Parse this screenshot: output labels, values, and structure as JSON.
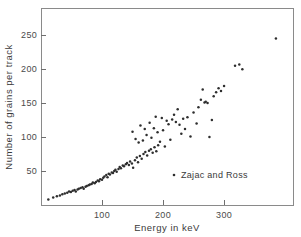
{
  "chart_data": {
    "type": "scatter",
    "title": "",
    "xlabel": "Energy in keV",
    "ylabel": "Number of grains per track",
    "xlim": [
      0,
      413
    ],
    "ylim": [
      0,
      290
    ],
    "xticks": [
      100,
      200,
      300
    ],
    "xtick_labels": [
      "100",
      "200",
      "300"
    ],
    "yticks": [
      50,
      100,
      150,
      200,
      250
    ],
    "ytick_labels": [
      "50",
      "100",
      "150",
      "200",
      "250"
    ],
    "grid": false,
    "legend_position": "center-right",
    "series": [
      {
        "name": "Zajac and Ross",
        "marker": "dot",
        "color": "#2e2e2e",
        "points": [
          [
            12,
            8
          ],
          [
            20,
            11
          ],
          [
            26,
            13
          ],
          [
            31,
            14
          ],
          [
            35,
            16
          ],
          [
            39,
            17
          ],
          [
            43,
            18
          ],
          [
            46,
            20
          ],
          [
            49,
            19
          ],
          [
            52,
            21
          ],
          [
            55,
            22
          ],
          [
            57,
            20
          ],
          [
            60,
            23
          ],
          [
            62,
            24
          ],
          [
            65,
            25
          ],
          [
            68,
            26
          ],
          [
            70,
            24
          ],
          [
            73,
            27
          ],
          [
            75,
            28
          ],
          [
            78,
            29
          ],
          [
            80,
            30
          ],
          [
            83,
            31
          ],
          [
            85,
            33
          ],
          [
            88,
            32
          ],
          [
            90,
            34
          ],
          [
            93,
            36
          ],
          [
            95,
            35
          ],
          [
            97,
            38
          ],
          [
            100,
            37
          ],
          [
            102,
            40
          ],
          [
            104,
            42
          ],
          [
            107,
            44
          ],
          [
            109,
            41
          ],
          [
            111,
            46
          ],
          [
            113,
            45
          ],
          [
            116,
            48
          ],
          [
            118,
            47
          ],
          [
            120,
            50
          ],
          [
            122,
            52
          ],
          [
            124,
            49
          ],
          [
            127,
            53
          ],
          [
            129,
            56
          ],
          [
            131,
            54
          ],
          [
            134,
            58
          ],
          [
            136,
            57
          ],
          [
            139,
            60
          ],
          [
            141,
            62
          ],
          [
            144,
            59
          ],
          [
            146,
            64
          ],
          [
            149,
            61
          ],
          [
            151,
            55
          ],
          [
            154,
            66
          ],
          [
            157,
            70
          ],
          [
            159,
            63
          ],
          [
            162,
            72
          ],
          [
            165,
            68
          ],
          [
            168,
            75
          ],
          [
            171,
            78
          ],
          [
            174,
            73
          ],
          [
            177,
            80
          ],
          [
            180,
            82
          ],
          [
            183,
            77
          ],
          [
            186,
            85
          ],
          [
            189,
            79
          ],
          [
            192,
            88
          ],
          [
            150,
            108
          ],
          [
            155,
            97
          ],
          [
            160,
            92
          ],
          [
            163,
            117
          ],
          [
            167,
            95
          ],
          [
            170,
            112
          ],
          [
            173,
            103
          ],
          [
            178,
            121
          ],
          [
            181,
            99
          ],
          [
            185,
            113
          ],
          [
            188,
            130
          ],
          [
            191,
            107
          ],
          [
            195,
            93
          ],
          [
            198,
            128
          ],
          [
            200,
            110
          ],
          [
            203,
            86
          ],
          [
            206,
            124
          ],
          [
            209,
            119
          ],
          [
            212,
            96
          ],
          [
            215,
            126
          ],
          [
            218,
            133
          ],
          [
            221,
            122
          ],
          [
            224,
            141
          ],
          [
            227,
            118
          ],
          [
            230,
            105
          ],
          [
            233,
            127
          ],
          [
            236,
            112
          ],
          [
            240,
            129
          ],
          [
            245,
            101
          ],
          [
            250,
            136
          ],
          [
            255,
            120
          ],
          [
            258,
            144
          ],
          [
            262,
            155
          ],
          [
            265,
            170
          ],
          [
            268,
            151
          ],
          [
            270,
            152
          ],
          [
            273,
            150
          ],
          [
            276,
            100
          ],
          [
            280,
            125
          ],
          [
            283,
            160
          ],
          [
            287,
            166
          ],
          [
            291,
            172
          ],
          [
            295,
            168
          ],
          [
            300,
            175
          ],
          [
            318,
            205
          ],
          [
            325,
            207
          ],
          [
            330,
            200
          ],
          [
            385,
            245
          ]
        ]
      }
    ]
  },
  "legend": {
    "entries": [
      {
        "label": "Zajac and Ross",
        "marker": "dot"
      }
    ]
  },
  "axes": {
    "x_title": "Energy in keV",
    "y_title": "Number of grains per track"
  }
}
